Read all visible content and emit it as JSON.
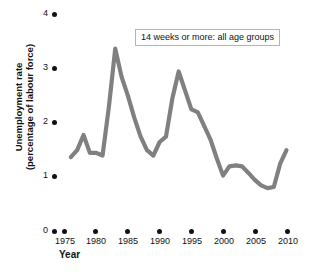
{
  "chart_data": {
    "type": "line",
    "title": "",
    "series_label": "14 weeks or more: all age groups",
    "xlabel": "Year",
    "ylabel": "Unemployment rate (percentage of labour force)",
    "xlim": [
      1975,
      2010
    ],
    "ylim": [
      0,
      4
    ],
    "grid": false,
    "legend_position": "inside-top-right",
    "line_color": "#808080",
    "xticks": [
      1975,
      1980,
      1985,
      1990,
      1995,
      2000,
      2005,
      2010
    ],
    "xtick_labels": [
      "1975",
      "1980",
      "1985",
      "1990",
      "1995",
      "2000",
      "2005",
      "2010"
    ],
    "yticks": [
      0,
      1,
      2,
      3,
      4
    ],
    "ytick_labels": [
      "0",
      "1",
      "2",
      "3",
      "4"
    ],
    "series": [
      {
        "name": "14 weeks or more: all age groups",
        "x": [
          1976,
          1977,
          1978,
          1979,
          1980,
          1981,
          1982,
          1983,
          1984,
          1985,
          1986,
          1987,
          1988,
          1989,
          1990,
          1991,
          1992,
          1993,
          1994,
          1995,
          1996,
          1997,
          1998,
          1999,
          2000,
          2001,
          2002,
          2003,
          2004,
          2005,
          2006,
          2007,
          2008,
          2009,
          2010
        ],
        "values": [
          1.37,
          1.5,
          1.78,
          1.45,
          1.45,
          1.4,
          2.3,
          3.37,
          2.85,
          2.5,
          2.1,
          1.75,
          1.5,
          1.4,
          1.65,
          1.75,
          2.45,
          2.95,
          2.6,
          2.25,
          2.2,
          1.95,
          1.7,
          1.35,
          1.03,
          1.2,
          1.22,
          1.2,
          1.08,
          0.95,
          0.85,
          0.8,
          0.82,
          1.25,
          1.5
        ]
      }
    ]
  },
  "axis": {
    "y_title": "Unemployment rate\n(percentage of labour force)",
    "y_title_line1": "Unemployment rate",
    "y_title_line2": "(percentage of labour force)",
    "x_title": "Year"
  }
}
